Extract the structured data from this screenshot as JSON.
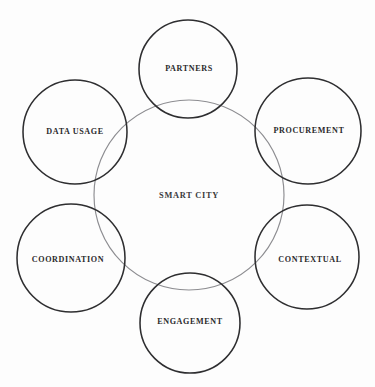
{
  "diagram": {
    "center": {
      "label": "SMART CITY",
      "cx": 189,
      "cy": 195,
      "r": 95,
      "stroke": "#8d8d91",
      "label_x": 189,
      "label_y": 196
    },
    "nodes": [
      {
        "id": "partners",
        "label": "PARTNERS",
        "cx": 188,
        "cy": 69,
        "r": 49,
        "stroke": "#2e2e30",
        "label_x": 189,
        "label_y": 69
      },
      {
        "id": "procurement",
        "label": "PROCUREMENT",
        "cx": 308,
        "cy": 131,
        "r": 53,
        "stroke": "#2e2e30",
        "label_x": 309,
        "label_y": 131
      },
      {
        "id": "contextual",
        "label": "CONTEXTUAL",
        "cx": 307,
        "cy": 257,
        "r": 52,
        "stroke": "#2e2e30",
        "label_x": 310,
        "label_y": 260
      },
      {
        "id": "engagement",
        "label": "ENGAGEMENT",
        "cx": 190,
        "cy": 323,
        "r": 50,
        "stroke": "#2e2e30",
        "label_x": 190,
        "label_y": 322
      },
      {
        "id": "coordination",
        "label": "COORDINATION",
        "cx": 71,
        "cy": 258,
        "r": 54,
        "stroke": "#2e2e30",
        "label_x": 68,
        "label_y": 260
      },
      {
        "id": "data-usage",
        "label": "DATA USAGE",
        "cx": 75,
        "cy": 132,
        "r": 52,
        "stroke": "#2e2e30",
        "label_x": 75,
        "label_y": 132
      }
    ],
    "colors": {
      "background": "#fdfdfd",
      "outer_stroke": "#2e2e30",
      "center_stroke": "#8d8d91",
      "text": "#2a2a2c"
    }
  }
}
